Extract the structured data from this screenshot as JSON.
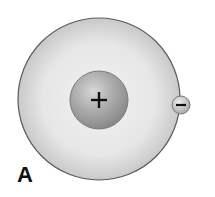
{
  "diagram": {
    "label": "A",
    "nucleus": {
      "symbol": "+",
      "charge": "positive"
    },
    "electron": {
      "symbol": "−",
      "charge": "negative"
    },
    "shell": {
      "shape": "circle"
    }
  },
  "colors": {
    "shell_fill": "#e4e4e4",
    "shell_edge": "#5a5a5a",
    "nucleus_fill": "#a9a9a9",
    "electron_fill": "#c8c8c8",
    "text": "#111111"
  }
}
